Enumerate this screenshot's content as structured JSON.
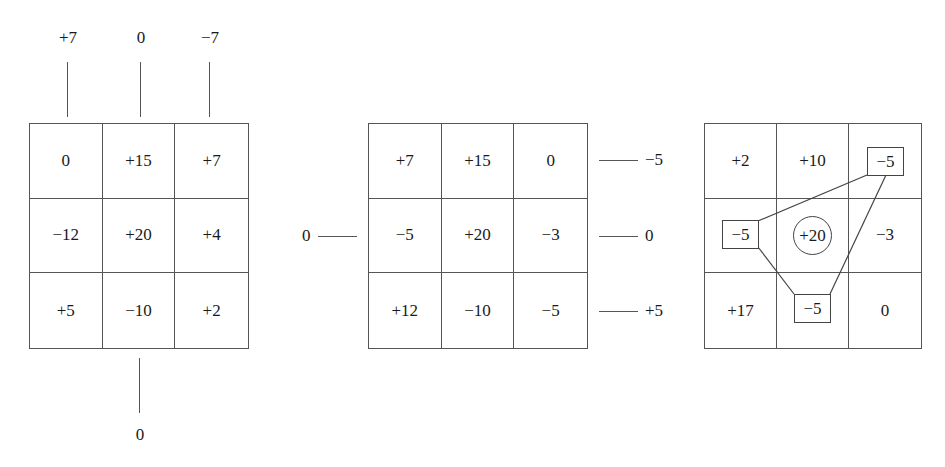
{
  "diagram_1": {
    "top_labels": [
      "+7",
      "0",
      "−7"
    ],
    "bottom_label": "0",
    "cells": [
      [
        "0",
        "+15",
        "+7"
      ],
      [
        "−12",
        "+20",
        "+4"
      ],
      [
        "+5",
        "−10",
        "+2"
      ]
    ]
  },
  "diagram_2": {
    "left_label": "0",
    "right_labels": [
      "−5",
      "0",
      "+5"
    ],
    "cells": [
      [
        "+7",
        "+15",
        "0"
      ],
      [
        "−5",
        "+20",
        "−3"
      ],
      [
        "+12",
        "−10",
        "−5"
      ]
    ]
  },
  "diagram_3": {
    "cells": [
      [
        "+2",
        "+10",
        "−5"
      ],
      [
        "−5",
        "+20",
        "−3"
      ],
      [
        "+17",
        "−5",
        "0"
      ]
    ],
    "boxed_values": {
      "top_right": "−5",
      "middle_left": "−5",
      "bottom_middle": "−5"
    },
    "circled_value": "+20"
  }
}
